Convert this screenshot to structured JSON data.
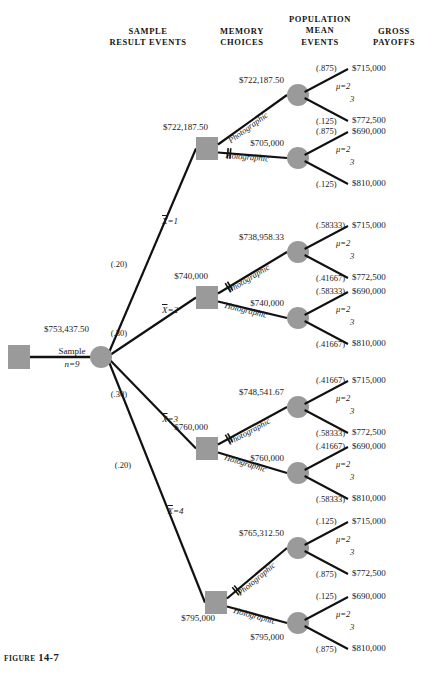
{
  "figure": {
    "prefix": "FIGURE",
    "number": "14-7"
  },
  "headers": [
    {
      "id": "sample-result-events",
      "line1": "SAMPLE",
      "line2": "RESULT EVENTS"
    },
    {
      "id": "memory-choices",
      "line1": "MEMORY",
      "line2": "CHOICES"
    },
    {
      "id": "population-mean-events",
      "line0": "POPULATION",
      "line1": "MEAN",
      "line2": "EVENTS"
    },
    {
      "id": "gross-payoffs",
      "line1": "GROSS",
      "line2": "PAYOFFS"
    }
  ],
  "root": {
    "value": "$753,437.50",
    "action": "Sample",
    "sample_size": "n=9"
  },
  "colors": {
    "node": "#9a9a9a",
    "line": "#111111",
    "text": "#1a1a1a"
  },
  "mu_label": {
    "top": "μ=2",
    "bottom": "3"
  },
  "choice_labels": {
    "photographic": "Photographic",
    "holographic": "Holographic"
  },
  "branches": [
    {
      "id": "xbar-1",
      "prob": "(.20)",
      "event": "X=1",
      "decision_value": "$722,187.50",
      "pruned": "holographic",
      "paths": [
        {
          "choice": "photographic",
          "node_value": "$722,187.50",
          "p_top": "(.875)",
          "p_bottom": "(.125)",
          "payoff_top": "$715,000",
          "payoff_bottom": "$772,500"
        },
        {
          "choice": "holographic",
          "node_value": "$705,000",
          "p_top": "(.875)",
          "p_bottom": "(.125)",
          "payoff_top": "$690,000",
          "payoff_bottom": "$810,000"
        }
      ]
    },
    {
      "id": "xbar-2",
      "prob": "(.30)",
      "event": "X=2",
      "decision_value": "$740,000",
      "pruned": "photographic",
      "paths": [
        {
          "choice": "photographic",
          "node_value": "$738,958.33",
          "p_top": "(.58333)",
          "p_bottom": "(.41667)",
          "payoff_top": "$715,000",
          "payoff_bottom": "$772,500"
        },
        {
          "choice": "holographic",
          "node_value": "$740,000",
          "p_top": "(.58333)",
          "p_bottom": "(.41667)",
          "payoff_top": "$690,000",
          "payoff_bottom": "$810,000"
        }
      ]
    },
    {
      "id": "xbar-3",
      "prob": "(.30)",
      "event": "X=3",
      "decision_value": "$760,000",
      "pruned": "photographic",
      "paths": [
        {
          "choice": "photographic",
          "node_value": "$748,541.67",
          "p_top": "(.41667)",
          "p_bottom": "(.58333)",
          "payoff_top": "$715,000",
          "payoff_bottom": "$772,500"
        },
        {
          "choice": "holographic",
          "node_value": "$760,000",
          "p_top": "(.41667)",
          "p_bottom": "(.58333)",
          "payoff_top": "$690,000",
          "payoff_bottom": "$810,000"
        }
      ]
    },
    {
      "id": "xbar-4",
      "prob": "(.20)",
      "event": "X=4",
      "decision_value": "$795,000",
      "pruned": "photographic",
      "paths": [
        {
          "choice": "photographic",
          "node_value": "$765,312.50",
          "p_top": "(.125)",
          "p_bottom": "(.875)",
          "payoff_top": "$715,000",
          "payoff_bottom": "$772,500"
        },
        {
          "choice": "holographic",
          "node_value": "$795,000",
          "p_top": "(.125)",
          "p_bottom": "(.875)",
          "payoff_top": "$690,000",
          "payoff_bottom": "$810,000"
        }
      ]
    }
  ]
}
